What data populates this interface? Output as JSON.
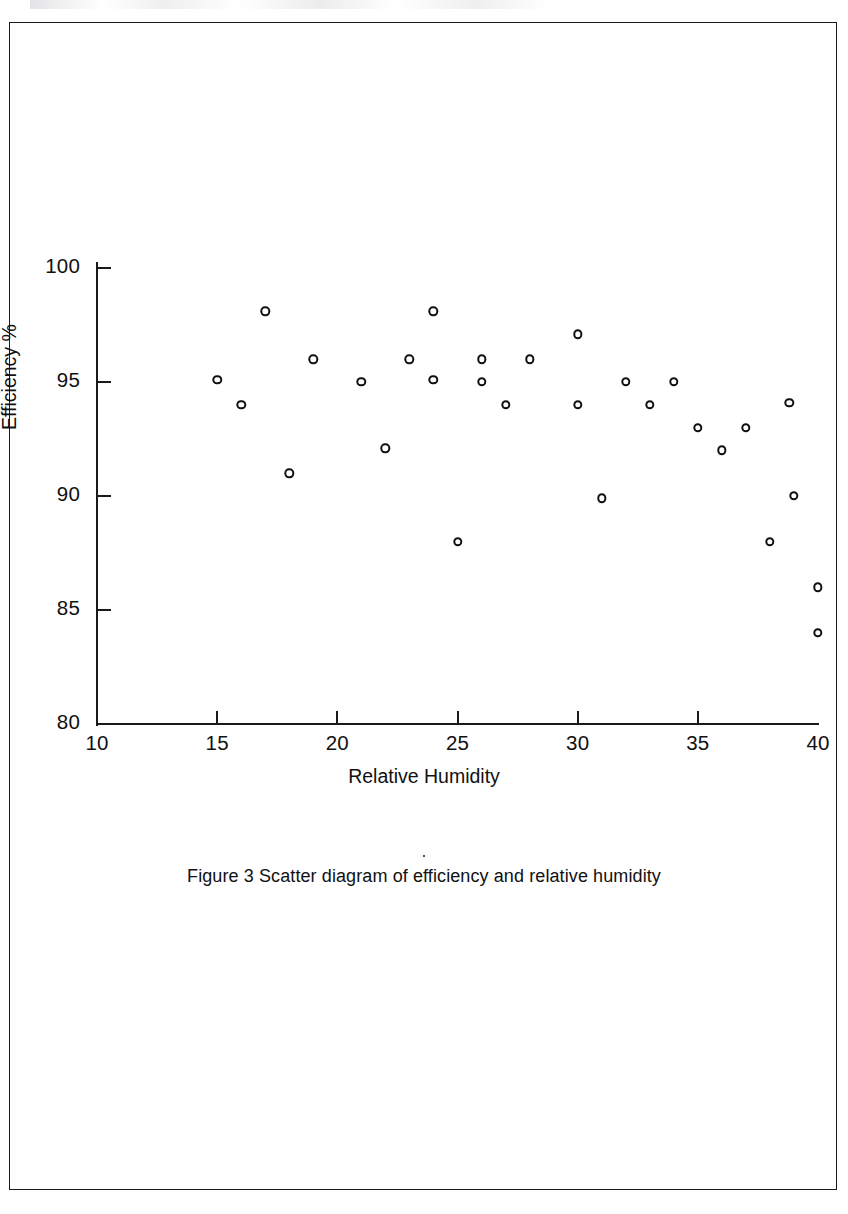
{
  "document": {
    "caption": "Figure 3  Scatter diagram of efficiency and relative humidity",
    "page_border_color": "#1a1a1a",
    "ink_color": "#111111",
    "background_color": "#ffffff"
  },
  "chart_data": {
    "type": "scatter",
    "title": "",
    "xlabel": "Relative Humidity",
    "ylabel": "Efficiency %",
    "xlim": [
      10,
      40
    ],
    "ylim": [
      80,
      100
    ],
    "xticks": [
      10,
      15,
      20,
      25,
      30,
      35,
      40
    ],
    "xticklabels": [
      "10",
      "15",
      "20",
      "25",
      "30",
      "35",
      "40"
    ],
    "yticks": [
      80,
      85,
      90,
      95,
      100
    ],
    "yticklabels": [
      "80",
      "85",
      "90",
      "95",
      "100"
    ],
    "grid": false,
    "legend": false,
    "marker": "open-circle",
    "marker_color": "#111111",
    "tick_direction": "in",
    "points": [
      {
        "x": 15.0,
        "y": 95.1
      },
      {
        "x": 16.0,
        "y": 94.0
      },
      {
        "x": 17.0,
        "y": 98.1
      },
      {
        "x": 18.0,
        "y": 91.0
      },
      {
        "x": 19.0,
        "y": 96.0
      },
      {
        "x": 21.0,
        "y": 95.0
      },
      {
        "x": 22.0,
        "y": 92.1
      },
      {
        "x": 23.0,
        "y": 96.0
      },
      {
        "x": 24.0,
        "y": 98.1
      },
      {
        "x": 24.0,
        "y": 95.1
      },
      {
        "x": 25.0,
        "y": 88.0
      },
      {
        "x": 26.0,
        "y": 96.0
      },
      {
        "x": 26.0,
        "y": 95.0
      },
      {
        "x": 27.0,
        "y": 94.0
      },
      {
        "x": 28.0,
        "y": 96.0
      },
      {
        "x": 30.0,
        "y": 97.1
      },
      {
        "x": 30.0,
        "y": 94.0
      },
      {
        "x": 31.0,
        "y": 89.9
      },
      {
        "x": 32.0,
        "y": 95.0
      },
      {
        "x": 33.0,
        "y": 94.0
      },
      {
        "x": 34.0,
        "y": 95.0
      },
      {
        "x": 35.0,
        "y": 93.0
      },
      {
        "x": 36.0,
        "y": 92.0
      },
      {
        "x": 37.0,
        "y": 93.0
      },
      {
        "x": 38.0,
        "y": 88.0
      },
      {
        "x": 38.8,
        "y": 94.1
      },
      {
        "x": 39.0,
        "y": 90.0
      },
      {
        "x": 40.0,
        "y": 86.0
      },
      {
        "x": 40.0,
        "y": 84.0
      }
    ]
  }
}
